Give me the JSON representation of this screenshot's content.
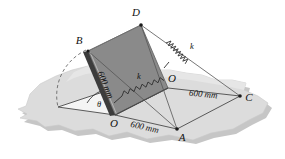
{
  "figure": {
    "labels": {
      "point_b": "B",
      "point_d": "D",
      "point_a": "A",
      "point_c": "C",
      "point_o_bottom": "O",
      "point_o_right": "O",
      "angle_theta": "θ",
      "spring_k_inner": "k",
      "spring_k_outer": "k",
      "dim_plate_edge": "600 mm",
      "dim_oa": "600 mm",
      "dim_oc": "600 mm"
    },
    "colors": {
      "plate_fill": "#8a8a8a",
      "plate_edge_dark": "#3c3c3c",
      "ground_fill": "#d9d9d9",
      "ground_shadow": "#c2c2c2",
      "line": "#444444",
      "spring": "#3a3a3a",
      "label_text": "#111111",
      "background": "#ffffff"
    },
    "geometry": {
      "vertex_B": [
        88,
        51
      ],
      "vertex_D": [
        141,
        25
      ],
      "vertex_O_right": [
        168,
        88
      ],
      "vertex_O_bottom": [
        115,
        115
      ],
      "vertex_A": [
        177,
        129
      ],
      "vertex_C": [
        240,
        96
      ],
      "base_left": [
        58,
        107
      ],
      "spring_inner_from": [
        115,
        98
      ],
      "spring_inner_to": [
        160,
        60
      ],
      "spring_outer_from": [
        237,
        94
      ],
      "spring_outer_to": [
        143,
        28
      ]
    }
  }
}
